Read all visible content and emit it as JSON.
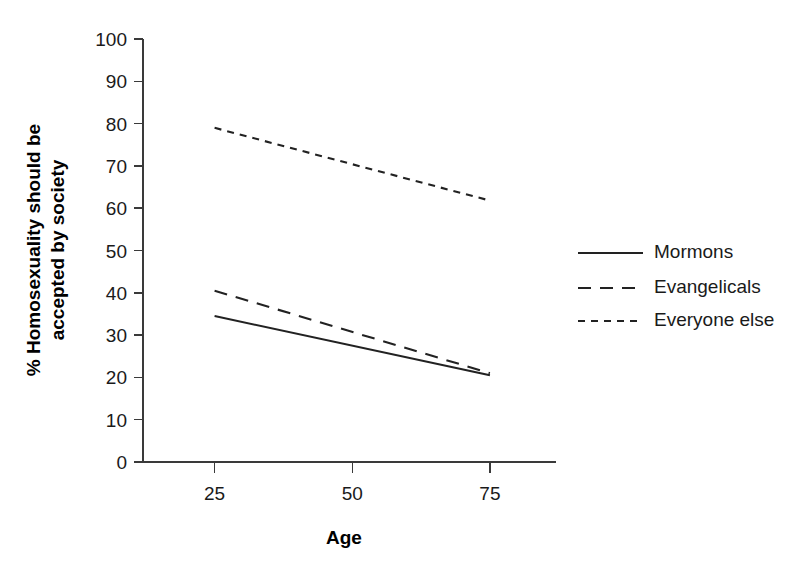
{
  "chart_data": {
    "type": "line",
    "title": "",
    "xlabel": "Age",
    "ylabel": "% Homosexuality should be accepted by society",
    "ylabel_line1": "% Homosexuality should be",
    "ylabel_line2": "accepted by society",
    "x": [
      25,
      75
    ],
    "xticks": [
      25,
      50,
      75
    ],
    "xtick_labels": [
      "25",
      "50",
      "75"
    ],
    "xlim": [
      12,
      87
    ],
    "ylim": [
      0,
      100
    ],
    "yticks": [
      0,
      10,
      20,
      30,
      40,
      50,
      60,
      70,
      80,
      90,
      100
    ],
    "ytick_labels": [
      "0",
      "10",
      "20",
      "30",
      "40",
      "50",
      "60",
      "70",
      "80",
      "90",
      "100"
    ],
    "grid": false,
    "legend_position": "right",
    "series": [
      {
        "name": "Mormons",
        "style": "solid",
        "color": "#222222",
        "x": [
          25,
          75
        ],
        "values": [
          34.5,
          20.5
        ]
      },
      {
        "name": "Evangelicals",
        "style": "dashed",
        "color": "#222222",
        "x": [
          25,
          75
        ],
        "values": [
          40.5,
          21.0
        ]
      },
      {
        "name": "Everyone else",
        "style": "dotted",
        "color": "#222222",
        "x": [
          25,
          75
        ],
        "values": [
          79.0,
          61.8
        ]
      }
    ]
  },
  "legend": {
    "items": [
      {
        "label": "Mormons",
        "style": "solid"
      },
      {
        "label": "Evangelicals",
        "style": "dashed"
      },
      {
        "label": "Everyone else",
        "style": "dotted"
      }
    ]
  }
}
